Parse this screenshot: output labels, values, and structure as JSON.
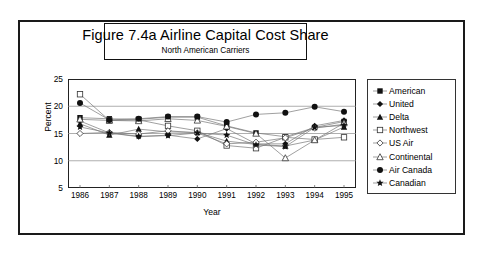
{
  "title": {
    "main": "Figure 7.4a  Airline Capital Cost Share",
    "sub": "North American Carriers"
  },
  "chart_data": {
    "type": "line",
    "title": "Figure 7.4a  Airline Capital Cost Share",
    "subtitle": "North American Carriers",
    "xlabel": "Year",
    "ylabel": "Percent",
    "categories": [
      "1986",
      "1987",
      "1988",
      "1989",
      "1990",
      "1991",
      "1992",
      "1993",
      "1994",
      "1995"
    ],
    "x": [
      1986,
      1987,
      1988,
      1989,
      1990,
      1991,
      1992,
      1993,
      1994,
      1995
    ],
    "ylim": [
      5,
      25
    ],
    "yticks": [
      5,
      10,
      15,
      20,
      25
    ],
    "xlim": [
      1986,
      1995
    ],
    "grid": "horizontal",
    "legend_position": "right",
    "series": [
      {
        "name": "American",
        "marker": "filled-square",
        "values": [
          17.9,
          17.7,
          17.6,
          18.0,
          18.0,
          16.4,
          15.1,
          14.4,
          16.1,
          17.2
        ]
      },
      {
        "name": "United",
        "marker": "filled-diamond",
        "values": [
          17.3,
          15.1,
          14.4,
          14.7,
          14.0,
          15.9,
          13.1,
          13.1,
          16.4,
          17.4
        ]
      },
      {
        "name": "Delta",
        "marker": "filled-triangle",
        "values": [
          16.8,
          14.7,
          15.8,
          15.3,
          15.2,
          13.6,
          13.0,
          12.7,
          13.8,
          16.2
        ]
      },
      {
        "name": "Northwest",
        "marker": "open-square",
        "values": [
          22.2,
          17.4,
          17.5,
          16.4,
          15.5,
          12.8,
          12.3,
          14.3,
          13.9,
          14.3
        ]
      },
      {
        "name": "US Air",
        "marker": "open-diamond",
        "values": [
          15.0,
          15.2,
          14.9,
          15.5,
          15.1,
          13.1,
          13.4,
          14.2,
          16.0,
          16.7
        ]
      },
      {
        "name": "Continental",
        "marker": "open-triangle",
        "values": [
          17.6,
          17.4,
          17.3,
          17.7,
          17.4,
          16.3,
          15.0,
          10.5,
          13.8,
          16.9
        ]
      },
      {
        "name": "Air Canada",
        "marker": "filled-circle",
        "values": [
          20.6,
          17.5,
          17.7,
          18.1,
          18.1,
          17.1,
          18.5,
          18.8,
          19.9,
          19.0
        ]
      },
      {
        "name": "Canadian",
        "marker": "filled-star",
        "values": [
          16.2,
          15.1,
          14.5,
          14.6,
          15.1,
          14.7,
          12.9,
          12.6,
          16.1,
          16.5
        ]
      }
    ]
  },
  "legend": {
    "items": [
      {
        "label": "American"
      },
      {
        "label": "United"
      },
      {
        "label": "Delta"
      },
      {
        "label": "Northwest"
      },
      {
        "label": "US Air"
      },
      {
        "label": "Continental"
      },
      {
        "label": "Air Canada"
      },
      {
        "label": "Canadian"
      }
    ]
  }
}
